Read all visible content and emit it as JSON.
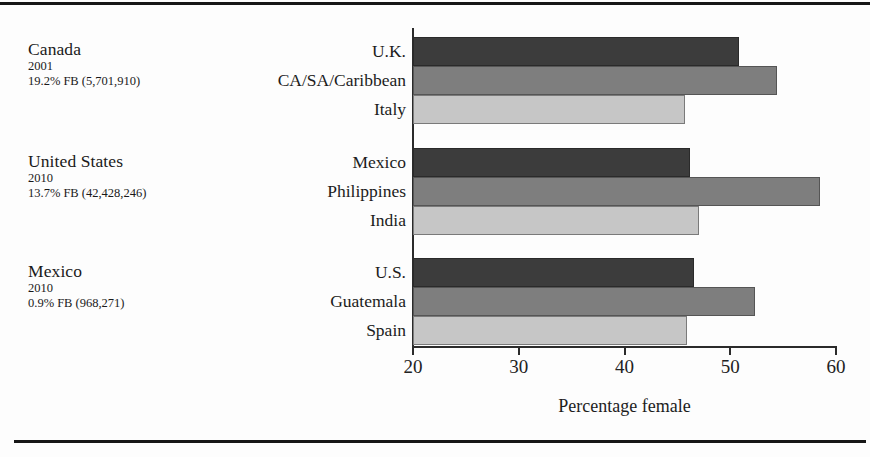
{
  "figure": {
    "axis_title": "Percentage female",
    "colors": {
      "series_dark": "#3c3c3c",
      "series_medium": "#7e7e7e",
      "series_light": "#c6c6c6",
      "axis": "#2b2b2b",
      "rule": "#161616"
    }
  },
  "panels": [
    {
      "country": "Canada",
      "year": "2001",
      "stat": "19.2% FB (5,701,910)",
      "origins": [
        "U.K.",
        "CA/SA/Caribbean",
        "Italy"
      ],
      "values": [
        50.8,
        54.4,
        45.7
      ]
    },
    {
      "country": "United States",
      "year": "2010",
      "stat": "13.7% FB (42,428,246)",
      "origins": [
        "Mexico",
        "Philippines",
        "India"
      ],
      "values": [
        46.2,
        58.5,
        47.0
      ]
    },
    {
      "country": "Mexico",
      "year": "2010",
      "stat": "0.9% FB (968,271)",
      "origins": [
        "U.S.",
        "Guatemala",
        "Spain"
      ],
      "values": [
        46.6,
        52.3,
        45.9
      ]
    }
  ],
  "axis": {
    "ticks": [
      20,
      30,
      40,
      50,
      60
    ],
    "tick_labels": [
      "20",
      "30",
      "40",
      "50",
      "60"
    ],
    "min": 20,
    "max": 60
  },
  "chart_data": {
    "type": "bar",
    "orientation": "horizontal",
    "title": "",
    "subtitle": "",
    "xlabel": "Percentage female",
    "ylabel": "",
    "xlim": [
      20,
      60
    ],
    "xticks": [
      20,
      30,
      40,
      50,
      60
    ],
    "grid": false,
    "legend": "none",
    "panel_layout": "three stacked groups of three bars, one group per destination country",
    "groups": [
      {
        "group_label": "Canada",
        "group_year": "2001",
        "group_note": "19.2% FB (5,701,910)",
        "categories": [
          "U.K.",
          "CA/SA/Caribbean",
          "Italy"
        ],
        "values": [
          50.8,
          54.4,
          45.7
        ],
        "shades": [
          "#3c3c3c",
          "#7e7e7e",
          "#c6c6c6"
        ]
      },
      {
        "group_label": "United States",
        "group_year": "2010",
        "group_note": "13.7% FB (42,428,246)",
        "categories": [
          "Mexico",
          "Philippines",
          "India"
        ],
        "values": [
          46.2,
          58.5,
          47.0
        ],
        "shades": [
          "#3c3c3c",
          "#7e7e7e",
          "#c6c6c6"
        ]
      },
      {
        "group_label": "Mexico",
        "group_year": "2010",
        "group_note": "0.9% FB (968,271)",
        "categories": [
          "U.S.",
          "Guatemala",
          "Spain"
        ],
        "values": [
          46.6,
          52.3,
          45.9
        ],
        "shades": [
          "#3c3c3c",
          "#7e7e7e",
          "#c6c6c6"
        ]
      }
    ],
    "annotations": []
  }
}
